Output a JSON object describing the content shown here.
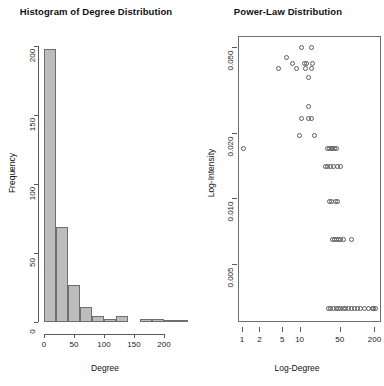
{
  "figure": {
    "width": 384,
    "height": 386,
    "background": "#ffffff",
    "panel_count": 2
  },
  "chart_data": [
    {
      "type": "bar",
      "title": "Histogram of Degree Distribution",
      "xlabel": "Degree",
      "ylabel": "Frequency",
      "xlim": [
        0,
        240
      ],
      "ylim": [
        0,
        200
      ],
      "xticks": [
        "0",
        "50",
        "100",
        "150",
        "200"
      ],
      "xtick_values": [
        0,
        50,
        100,
        150,
        200
      ],
      "yticks": [
        "0",
        "50",
        "100",
        "150",
        "200"
      ],
      "ytick_values": [
        0,
        50,
        100,
        150,
        200
      ],
      "grid": false,
      "legend": "none",
      "bin_width": 20,
      "bin_starts": [
        0,
        20,
        40,
        60,
        80,
        100,
        120,
        140,
        160,
        180,
        200,
        220
      ],
      "values": [
        198,
        69,
        27,
        11,
        4,
        2,
        4,
        0,
        2,
        2,
        1,
        1
      ],
      "bar_fill": "#bcbcbc",
      "bar_border": "#6e6e6e"
    },
    {
      "type": "scatter",
      "title": "Power-Law Distribution",
      "xlabel": "Log-Degree",
      "ylabel": "Log-Intensity",
      "xscale": "log",
      "yscale": "log",
      "xlim": [
        0.85,
        260
      ],
      "ylim": [
        0.0027,
        0.056
      ],
      "xticks": [
        "1",
        "2",
        "5",
        "10",
        "50",
        "200"
      ],
      "xtick_values": [
        1,
        2,
        5,
        10,
        50,
        200
      ],
      "yticks": [
        "0.005",
        "0.010",
        "0.020",
        "0.050"
      ],
      "ytick_values": [
        0.005,
        0.01,
        0.02,
        0.05
      ],
      "grid": false,
      "legend": "none",
      "marker": "open-circle",
      "marker_color": "#5d5d5d",
      "points": [
        [
          11,
          0.0495
        ],
        [
          16,
          0.0495
        ],
        [
          6,
          0.0447
        ],
        [
          7.5,
          0.0418
        ],
        [
          12,
          0.0418
        ],
        [
          13,
          0.0418
        ],
        [
          17,
          0.0418
        ],
        [
          4.3,
          0.0395
        ],
        [
          9,
          0.0395
        ],
        [
          12.5,
          0.0395
        ],
        [
          16,
          0.0395
        ],
        [
          14,
          0.0362
        ],
        [
          14,
          0.0265
        ],
        [
          11,
          0.0233
        ],
        [
          14,
          0.0233
        ],
        [
          16,
          0.0233
        ],
        [
          10,
          0.0196
        ],
        [
          18,
          0.0196
        ],
        [
          1.05,
          0.017
        ],
        [
          30,
          0.017
        ],
        [
          33,
          0.017
        ],
        [
          36,
          0.017
        ],
        [
          38,
          0.017
        ],
        [
          41,
          0.017
        ],
        [
          44,
          0.017
        ],
        [
          28,
          0.014
        ],
        [
          31,
          0.014
        ],
        [
          35,
          0.014
        ],
        [
          39,
          0.014
        ],
        [
          46,
          0.014
        ],
        [
          51,
          0.014
        ],
        [
          33,
          0.0097
        ],
        [
          36,
          0.0097
        ],
        [
          42,
          0.0097
        ],
        [
          46,
          0.0097
        ],
        [
          38,
          0.0065
        ],
        [
          41,
          0.0065
        ],
        [
          44,
          0.0065
        ],
        [
          48,
          0.0065
        ],
        [
          52,
          0.0065
        ],
        [
          57,
          0.0065
        ],
        [
          80,
          0.0065
        ],
        [
          32,
          0.0031
        ],
        [
          35,
          0.0031
        ],
        [
          39,
          0.0031
        ],
        [
          43,
          0.0031
        ],
        [
          47,
          0.0031
        ],
        [
          52,
          0.0031
        ],
        [
          58,
          0.0031
        ],
        [
          64,
          0.0031
        ],
        [
          72,
          0.0031
        ],
        [
          80,
          0.0031
        ],
        [
          90,
          0.0031
        ],
        [
          102,
          0.0031
        ],
        [
          115,
          0.0031
        ],
        [
          135,
          0.0031
        ],
        [
          160,
          0.0031
        ],
        [
          185,
          0.0031
        ],
        [
          196,
          0.0031
        ],
        [
          205,
          0.0031
        ]
      ]
    }
  ]
}
